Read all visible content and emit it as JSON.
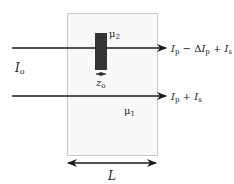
{
  "diagram": {
    "medium": {
      "outer_label": "μ",
      "outer_subscript": "1",
      "box_fill": "#f8f8f8",
      "box_stroke": "#c8c8c8"
    },
    "inclusion": {
      "label": "μ",
      "label_subscript": "2",
      "fill": "#333333",
      "width_label": "z",
      "width_subscript": "o"
    },
    "input_beam": {
      "label": "I",
      "label_subscript": "o"
    },
    "output_top": {
      "parts": [
        "I",
        "p",
        " − Δ",
        "I",
        "p",
        " + ",
        "I",
        "s"
      ]
    },
    "output_bottom": {
      "parts": [
        "I",
        "p",
        " + ",
        "I",
        "s"
      ]
    },
    "length": {
      "label": "L"
    },
    "colors": {
      "line": "#1a1a1a"
    }
  }
}
